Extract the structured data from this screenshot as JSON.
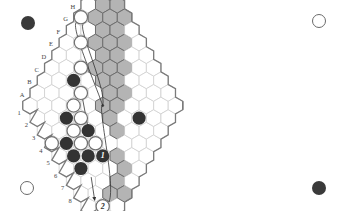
{
  "board": {
    "size": 11,
    "col_labels": [
      "A",
      "B",
      "C",
      "D",
      "E",
      "F",
      "G",
      "H",
      "I",
      "J",
      "K"
    ],
    "row_labels": [
      "1",
      "2",
      "3",
      "4",
      "5",
      "6",
      "7",
      "8",
      "9",
      "10",
      "11"
    ],
    "colors": {
      "cell_fill": "#ffffff",
      "cell_stroke": "#cfcfcf",
      "shaded_fill": "#b4b4b4",
      "shaded_stroke": "#6e6e6e",
      "edge_stroke": "#7a7a7a",
      "black_stone": "#333333",
      "white_stone": "#ffffff",
      "white_stone_stroke": "#707070",
      "label": "#444444",
      "arrow": "#333333"
    },
    "shaded_cells": [
      [
        10,
        0
      ],
      [
        10,
        1
      ],
      [
        10,
        2
      ],
      [
        9,
        0
      ],
      [
        9,
        1
      ],
      [
        9,
        2
      ],
      [
        9,
        3
      ],
      [
        8,
        1
      ],
      [
        8,
        2
      ],
      [
        8,
        3
      ],
      [
        8,
        4
      ],
      [
        7,
        2
      ],
      [
        7,
        3
      ],
      [
        7,
        4
      ],
      [
        7,
        5
      ],
      [
        6,
        3
      ],
      [
        6,
        4
      ],
      [
        6,
        5
      ],
      [
        6,
        6
      ],
      [
        5,
        5
      ],
      [
        5,
        6
      ],
      [
        5,
        7
      ],
      [
        4,
        8
      ],
      [
        10,
        3
      ],
      [
        9,
        4
      ],
      [
        8,
        5
      ],
      [
        7,
        6
      ],
      [
        3,
        9
      ],
      [
        4,
        9
      ],
      [
        3,
        10
      ],
      [
        2,
        9
      ]
    ],
    "black_stones": [
      {
        "col": 4,
        "row": 2
      },
      {
        "col": 2,
        "row": 3
      },
      {
        "col": 1,
        "row": 4
      },
      {
        "col": 1,
        "row": 5
      },
      {
        "col": 1,
        "row": 6
      },
      {
        "col": 3,
        "row": 5
      },
      {
        "col": 2,
        "row": 6
      },
      {
        "col": 3,
        "row": 7,
        "label": "1"
      },
      {
        "col": 7,
        "row": 8
      }
    ],
    "white_stones": [
      {
        "col": 0,
        "row": 3
      },
      {
        "col": 5,
        "row": 2
      },
      {
        "col": 3,
        "row": 3
      },
      {
        "col": 2,
        "row": 4
      },
      {
        "col": 6,
        "row": 1
      },
      {
        "col": 4,
        "row": 3
      },
      {
        "col": 3,
        "row": 4
      },
      {
        "col": 2,
        "row": 5
      },
      {
        "col": 3,
        "row": 6
      },
      {
        "col": 7,
        "row": 0
      },
      {
        "col": 1,
        "row": 9,
        "label": "2"
      }
    ]
  },
  "corners": [
    {
      "pos": "top-left",
      "color": "black"
    },
    {
      "pos": "top-right",
      "color": "white"
    },
    {
      "pos": "bottom-left",
      "color": "white"
    },
    {
      "pos": "bottom-right",
      "color": "black"
    }
  ]
}
